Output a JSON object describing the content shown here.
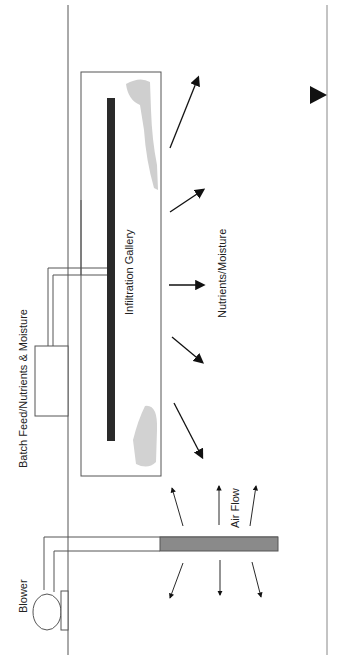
{
  "diagram": {
    "labels": {
      "batch_feed": "Batch Feed/Nutrients & Moisture",
      "infiltration_gallery": "Infiltration Gallery",
      "nutrients_moisture": "Nutrients/Moisture",
      "air_flow": "Air Flow",
      "blower": "Blower"
    },
    "colors": {
      "line": "#555555",
      "gallery_pipe": "#2a2a2a",
      "plume": "#c8c8c8",
      "well_screen": "#8a8a8a",
      "arrow": "#111111"
    }
  }
}
